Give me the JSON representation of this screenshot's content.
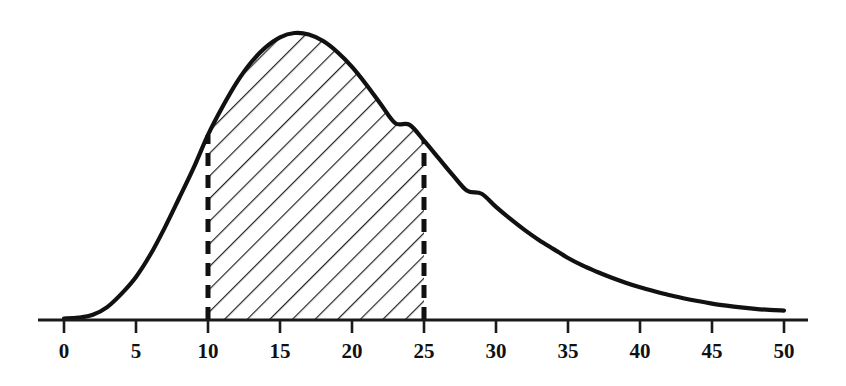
{
  "figure": {
    "title": "",
    "background_color": "#ffffff",
    "curve_color": "#111111",
    "hatch_color": "#222222",
    "axis_color": "#1a1a1a"
  },
  "axis": {
    "label": "x-axis",
    "tick_labels": [
      "0",
      "5",
      "10",
      "15",
      "20",
      "25",
      "30",
      "35",
      "40",
      "45",
      "50"
    ],
    "tick_values": [
      0,
      5,
      10,
      15,
      20,
      25,
      30,
      35,
      40,
      45,
      50
    ],
    "range": [
      0,
      50
    ],
    "line_start_px": 38,
    "line_end_px": 808,
    "baseline_y_px": 320
  },
  "shaded_region": {
    "name": "hatched-area",
    "lower_bound": 10,
    "upper_bound": 25,
    "fill_style": "diagonal-hatch",
    "boundary_style": "dashed"
  },
  "chart_data": {
    "type": "area",
    "title": "",
    "subtitle": "",
    "xlabel": "",
    "ylabel": "",
    "xlim": [
      0,
      50
    ],
    "ylim": [
      0,
      1
    ],
    "grid": false,
    "legend": null,
    "peak_x": 15.9,
    "peak_y": 1.0,
    "shade_from": 10,
    "shade_to": 25,
    "x": [
      0,
      1,
      2,
      3,
      4,
      5,
      6,
      7,
      8,
      9,
      10,
      11,
      12,
      13,
      14,
      15,
      16,
      17,
      18,
      19,
      20,
      21,
      22,
      23,
      24,
      25,
      26,
      27,
      28,
      29,
      30,
      31,
      32,
      33,
      34,
      35,
      36,
      37,
      38,
      39,
      40,
      41,
      42,
      43,
      44,
      45,
      46,
      47,
      48,
      49,
      50
    ],
    "y": [
      0.005,
      0.008,
      0.018,
      0.045,
      0.092,
      0.15,
      0.228,
      0.322,
      0.425,
      0.53,
      0.645,
      0.742,
      0.828,
      0.898,
      0.95,
      0.985,
      1.0,
      0.995,
      0.972,
      0.933,
      0.882,
      0.82,
      0.752,
      0.686,
      0.68,
      0.625,
      0.565,
      0.505,
      0.45,
      0.44,
      0.394,
      0.352,
      0.313,
      0.278,
      0.247,
      0.216,
      0.19,
      0.168,
      0.148,
      0.13,
      0.114,
      0.1,
      0.087,
      0.076,
      0.066,
      0.057,
      0.05,
      0.044,
      0.039,
      0.035,
      0.033
    ],
    "tick_labels": [
      "0",
      "5",
      "10",
      "15",
      "20",
      "25",
      "30",
      "35",
      "40",
      "45",
      "50"
    ],
    "tick_values": [
      0,
      5,
      10,
      15,
      20,
      25,
      30,
      35,
      40,
      45,
      50
    ]
  }
}
